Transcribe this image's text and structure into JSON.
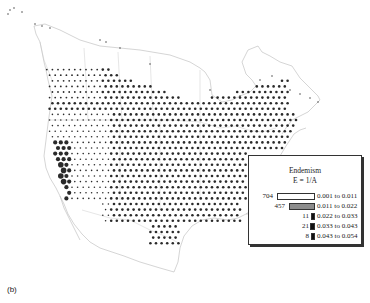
{
  "chart_data": {
    "type": "heatmap",
    "title": "Endemism",
    "subtitle": "E = 1/A",
    "panel_label": "(b)",
    "legend": {
      "position": "lower-right",
      "entries": [
        {
          "count": 704,
          "range": "0.001 to 0.011",
          "min": 0.001,
          "max": 0.011,
          "bar_width": 40,
          "fill": "#ffffff"
        },
        {
          "count": 457,
          "range": "0.011 to 0.022",
          "min": 0.011,
          "max": 0.022,
          "bar_width": 26,
          "fill": "#8c8c8c"
        },
        {
          "count": 11,
          "range": "0.022 to 0.033",
          "min": 0.022,
          "max": 0.033,
          "bar_width": 4,
          "fill": "#111111"
        },
        {
          "count": 21,
          "range": "0.033 to 0.043",
          "min": 0.033,
          "max": 0.043,
          "bar_width": 5,
          "fill": "#111111"
        },
        {
          "count": 8,
          "range": "0.043 to 0.054",
          "min": 0.043,
          "max": 0.054,
          "bar_width": 4,
          "fill": "#111111"
        }
      ]
    },
    "high_endemism_region": "California coast",
    "grid": false
  },
  "legend": {
    "title": "Endemism",
    "subtitle": "E = 1/A",
    "rows": [
      {
        "count": "704",
        "range": "0.001 to 0.011"
      },
      {
        "count": "457",
        "range": "0.011 to 0.022"
      },
      {
        "count": "11",
        "range": "0.022 to 0.033"
      },
      {
        "count": "21",
        "range": "0.033 to 0.043"
      },
      {
        "count": "8",
        "range": "0.043 to 0.054"
      }
    ]
  },
  "panel_label": "(b)"
}
